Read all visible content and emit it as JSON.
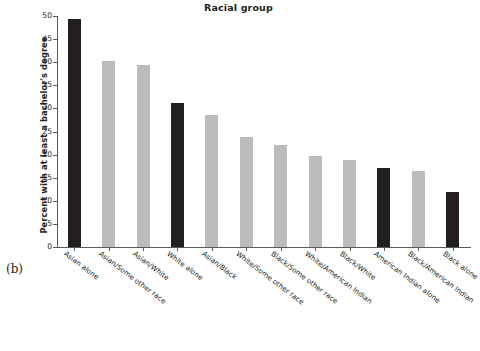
{
  "panel": {
    "letter": "(b)"
  },
  "chart_data": {
    "type": "bar",
    "title": "Racial group",
    "xlabel": "",
    "ylabel": "Percent with at least a bachelor's degree",
    "ylim": [
      0,
      50
    ],
    "yticks": [
      0,
      5,
      10,
      15,
      20,
      25,
      30,
      35,
      40,
      45,
      50
    ],
    "ytick_labels": [
      "0",
      "5",
      "10",
      "15",
      "20",
      "25",
      "30",
      "35",
      "40",
      "45",
      "50"
    ],
    "grid": false,
    "legend": null,
    "categories": [
      "Asian alone",
      "Asian/Some other race",
      "Asian/White",
      "White alone",
      "Asian/Black",
      "White/Some other race",
      "Black/Some other race",
      "White/American Indian",
      "Black/White",
      "American Indian alone",
      "Black/American Indian",
      "Black alone"
    ],
    "values": [
      49.3,
      40.2,
      39.3,
      31.1,
      28.5,
      23.8,
      22.1,
      19.6,
      18.8,
      17.2,
      16.5,
      12.0
    ],
    "bar_colors": [
      "#231f20",
      "#bcbcbc",
      "#bcbcbc",
      "#231f20",
      "#bcbcbc",
      "#bcbcbc",
      "#bcbcbc",
      "#bcbcbc",
      "#bcbcbc",
      "#231f20",
      "#bcbcbc",
      "#231f20"
    ],
    "colors": {
      "single_race": "#231f20",
      "multi_race": "#bcbcbc",
      "axis": "#58595b",
      "text": "#231f20"
    }
  }
}
